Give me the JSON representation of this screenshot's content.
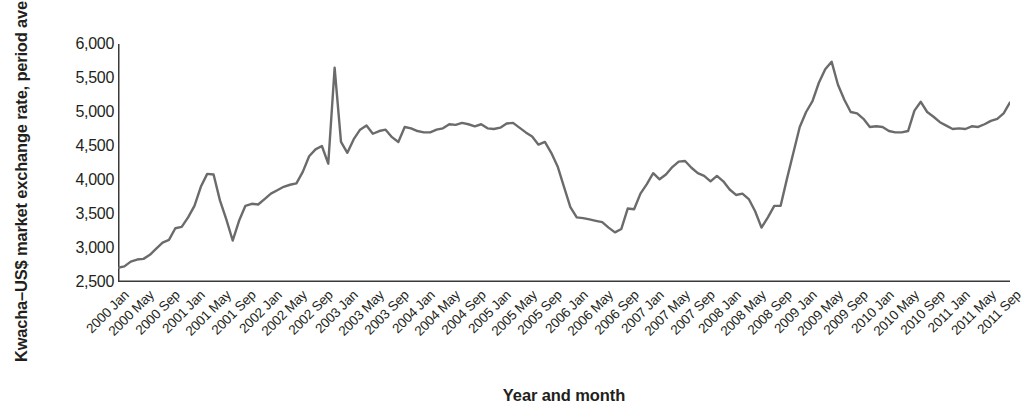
{
  "chart_data": {
    "type": "line",
    "title": "",
    "xlabel": "Year and month",
    "ylabel": "Kwacha–US$ market exchange rate, period average",
    "ylim": [
      2500,
      6000
    ],
    "yticks": [
      2500,
      3000,
      3500,
      4000,
      4500,
      5000,
      5500,
      6000
    ],
    "ytick_labels": [
      "2,500",
      "3,000",
      "3,500",
      "4,000",
      "4,500",
      "5,000",
      "5,500",
      "6,000"
    ],
    "grid": false,
    "legend": "none",
    "line_color": "#6b6b6b",
    "x_tick_interval_months": 4,
    "x_tick_labels": [
      "2000 Jan",
      "2000 May",
      "2000 Sep",
      "2001 Jan",
      "2001 May",
      "2001 Sep",
      "2002 Jan",
      "2002 May",
      "2002 Sep",
      "2003 Jan",
      "2003 May",
      "2003 Sep",
      "2004 Jan",
      "2004 May",
      "2004 Sep",
      "2005 Jan",
      "2005 May",
      "2005 Sep",
      "2006 Jan",
      "2006 May",
      "2006 Sep",
      "2007 Jan",
      "2007 May",
      "2007 Sep",
      "2008 Jan",
      "2008 May",
      "2008 Sep",
      "2009 Jan",
      "2009 May",
      "2009 Sep",
      "2010 Jan",
      "2010 May",
      "2010 Sep",
      "2011 Jan",
      "2011 May",
      "2011 Sep"
    ],
    "series": [
      {
        "name": "Kwacha–US$ market exchange rate, period average",
        "x": [
          "2000 Jan",
          "2000 Feb",
          "2000 Mar",
          "2000 Apr",
          "2000 May",
          "2000 Jun",
          "2000 Jul",
          "2000 Aug",
          "2000 Sep",
          "2000 Oct",
          "2000 Nov",
          "2000 Dec",
          "2001 Jan",
          "2001 Feb",
          "2001 Mar",
          "2001 Apr",
          "2001 May",
          "2001 Jun",
          "2001 Jul",
          "2001 Aug",
          "2001 Sep",
          "2001 Oct",
          "2001 Nov",
          "2001 Dec",
          "2002 Jan",
          "2002 Feb",
          "2002 Mar",
          "2002 Apr",
          "2002 May",
          "2002 Jun",
          "2002 Jul",
          "2002 Aug",
          "2002 Sep",
          "2002 Oct",
          "2002 Nov",
          "2002 Dec",
          "2003 Jan",
          "2003 Feb",
          "2003 Mar",
          "2003 Apr",
          "2003 May",
          "2003 Jun",
          "2003 Jul",
          "2003 Aug",
          "2003 Sep",
          "2003 Oct",
          "2003 Nov",
          "2003 Dec",
          "2004 Jan",
          "2004 Feb",
          "2004 Mar",
          "2004 Apr",
          "2004 May",
          "2004 Jun",
          "2004 Jul",
          "2004 Aug",
          "2004 Sep",
          "2004 Oct",
          "2004 Nov",
          "2004 Dec",
          "2005 Jan",
          "2005 Feb",
          "2005 Mar",
          "2005 Apr",
          "2005 May",
          "2005 Jun",
          "2005 Jul",
          "2005 Aug",
          "2005 Sep",
          "2005 Oct",
          "2005 Nov",
          "2005 Dec",
          "2006 Jan",
          "2006 Feb",
          "2006 Mar",
          "2006 Apr",
          "2006 May",
          "2006 Jun",
          "2006 Jul",
          "2006 Aug",
          "2006 Sep",
          "2006 Oct",
          "2006 Nov",
          "2006 Dec",
          "2007 Jan",
          "2007 Feb",
          "2007 Mar",
          "2007 Apr",
          "2007 May",
          "2007 Jun",
          "2007 Jul",
          "2007 Aug",
          "2007 Sep",
          "2007 Oct",
          "2007 Nov",
          "2007 Dec",
          "2008 Jan",
          "2008 Feb",
          "2008 Mar",
          "2008 Apr",
          "2008 May",
          "2008 Jun",
          "2008 Jul",
          "2008 Aug",
          "2008 Sep",
          "2008 Oct",
          "2008 Nov",
          "2008 Dec",
          "2009 Jan",
          "2009 Feb",
          "2009 Mar",
          "2009 Apr",
          "2009 May",
          "2009 Jun",
          "2009 Jul",
          "2009 Aug",
          "2009 Sep",
          "2009 Oct",
          "2009 Nov",
          "2009 Dec",
          "2010 Jan",
          "2010 Feb",
          "2010 Mar",
          "2010 Apr",
          "2010 May",
          "2010 Jun",
          "2010 Jul",
          "2010 Aug",
          "2010 Sep",
          "2010 Oct",
          "2010 Nov",
          "2010 Dec",
          "2011 Jan",
          "2011 Feb",
          "2011 Mar",
          "2011 Apr",
          "2011 May",
          "2011 Jun",
          "2011 Jul",
          "2011 Aug",
          "2011 Sep"
        ],
        "values": [
          2710,
          2730,
          2800,
          2830,
          2840,
          2900,
          2990,
          3080,
          3120,
          3290,
          3310,
          3450,
          3620,
          3900,
          4090,
          4080,
          3700,
          3420,
          3110,
          3400,
          3620,
          3650,
          3640,
          3720,
          3800,
          3850,
          3900,
          3930,
          3950,
          4120,
          4350,
          4450,
          4500,
          4240,
          5650,
          4560,
          4400,
          4600,
          4740,
          4800,
          4680,
          4720,
          4740,
          4630,
          4560,
          4780,
          4760,
          4720,
          4700,
          4700,
          4740,
          4760,
          4820,
          4810,
          4840,
          4820,
          4790,
          4820,
          4760,
          4750,
          4770,
          4830,
          4840,
          4770,
          4700,
          4640,
          4520,
          4560,
          4400,
          4200,
          3900,
          3600,
          3450,
          3440,
          3420,
          3400,
          3380,
          3300,
          3230,
          3280,
          3580,
          3570,
          3800,
          3940,
          4100,
          4010,
          4080,
          4190,
          4270,
          4280,
          4180,
          4100,
          4060,
          3980,
          4060,
          3980,
          3860,
          3780,
          3800,
          3720,
          3540,
          3300,
          3450,
          3620,
          3620,
          4020,
          4400,
          4780,
          5000,
          5160,
          5430,
          5630,
          5740,
          5400,
          5180,
          5000,
          4980,
          4900,
          4780,
          4790,
          4780,
          4720,
          4700,
          4700,
          4720,
          5020,
          5150,
          5000,
          4930,
          4850,
          4800,
          4750,
          4760,
          4750,
          4790,
          4780,
          4820,
          4870,
          4900,
          4980,
          5140
        ]
      }
    ]
  }
}
